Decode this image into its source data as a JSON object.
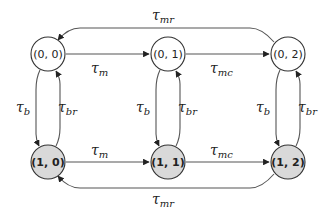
{
  "diagram": {
    "type": "state-transition",
    "colors": {
      "stroke": "#333333",
      "edge": "#555555",
      "unfilled": "#ffffff",
      "filled": "#d9d9d9"
    },
    "nodes": [
      {
        "id": "n00",
        "label": "(0, 0)",
        "filled": false
      },
      {
        "id": "n01",
        "label": "(0, 1)",
        "filled": false
      },
      {
        "id": "n02",
        "label": "(0, 2)",
        "filled": false
      },
      {
        "id": "n10",
        "label": "(1, 0)",
        "filled": true
      },
      {
        "id": "n11",
        "label": "(1, 1)",
        "filled": true
      },
      {
        "id": "n12",
        "label": "(1, 2)",
        "filled": true
      }
    ],
    "edges": [
      {
        "from": "n00",
        "to": "n01",
        "label": {
          "base": "τ",
          "sub": "m"
        }
      },
      {
        "from": "n01",
        "to": "n02",
        "label": {
          "base": "τ",
          "sub": "mc"
        }
      },
      {
        "from": "n02",
        "to": "n00",
        "label": {
          "base": "τ",
          "sub": "mr"
        }
      },
      {
        "from": "n10",
        "to": "n11",
        "label": {
          "base": "τ",
          "sub": "m"
        }
      },
      {
        "from": "n11",
        "to": "n12",
        "label": {
          "base": "τ",
          "sub": "mc"
        }
      },
      {
        "from": "n12",
        "to": "n10",
        "label": {
          "base": "τ",
          "sub": "mr"
        }
      },
      {
        "from": "n00",
        "to": "n10",
        "label": {
          "base": "τ",
          "sub": "b"
        }
      },
      {
        "from": "n10",
        "to": "n00",
        "label": {
          "base": "τ",
          "sub": "br"
        }
      },
      {
        "from": "n01",
        "to": "n11",
        "label": {
          "base": "τ",
          "sub": "b"
        }
      },
      {
        "from": "n11",
        "to": "n01",
        "label": {
          "base": "τ",
          "sub": "br"
        }
      },
      {
        "from": "n02",
        "to": "n12",
        "label": {
          "base": "τ",
          "sub": "b"
        }
      },
      {
        "from": "n12",
        "to": "n02",
        "label": {
          "base": "τ",
          "sub": "br"
        }
      }
    ]
  }
}
